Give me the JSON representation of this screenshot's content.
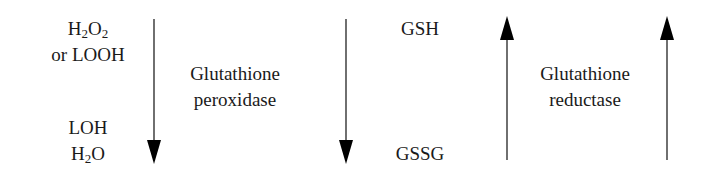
{
  "left_compounds": {
    "top": {
      "line1_prefix": "H",
      "line1_sub1": "2",
      "line1_mid": "O",
      "line1_sub2": "2",
      "line2": "or LOOH"
    },
    "bottom": {
      "line1": "LOH",
      "line2_prefix": "H",
      "line2_sub": "2",
      "line2_suffix": "O"
    }
  },
  "enzyme_1": {
    "line1": "Glutathione",
    "line2": "peroxidase"
  },
  "middle_compounds": {
    "top": "GSH",
    "bottom": "GSSG"
  },
  "enzyme_2": {
    "line1": "Glutathione",
    "line2": "reductase"
  },
  "arrows": [
    {
      "id": "arrow-1",
      "direction": "down"
    },
    {
      "id": "arrow-2",
      "direction": "down"
    },
    {
      "id": "arrow-3",
      "direction": "up"
    },
    {
      "id": "arrow-4",
      "direction": "up"
    }
  ],
  "colors": {
    "text": "#1a1a1a",
    "arrow": "#000000"
  }
}
